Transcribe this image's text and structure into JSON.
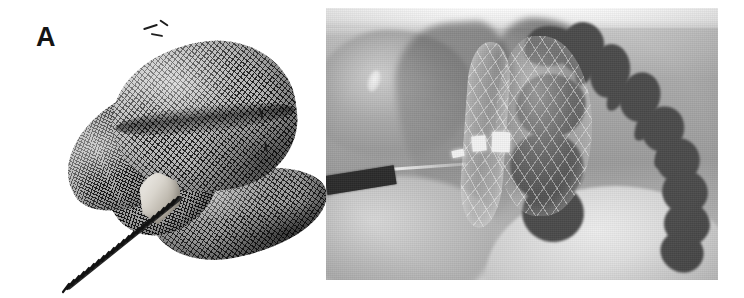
{
  "figure": {
    "panel_label": "A",
    "caption": "",
    "background_color": "#ffffff"
  },
  "device_panel": {
    "name": "braided-nitinol-occluder-photograph",
    "description": "Photograph of a self-expanding braided nitinol mesh occluder device with flared retention disc, conical hub and flexible delivery coil cable",
    "components": [
      {
        "id": "mesh-body",
        "label": "braided mesh cylindrical body"
      },
      {
        "id": "mesh-skirt",
        "label": "flared retention disc"
      },
      {
        "id": "mesh-rim",
        "label": "lower flange rim"
      },
      {
        "id": "mesh-flap",
        "label": "mesh flap"
      },
      {
        "id": "hub",
        "label": "conical screw hub"
      },
      {
        "id": "coil",
        "label": "flexible delivery coil cable"
      },
      {
        "id": "whiskers",
        "label": "protruding nitinol wire ends"
      }
    ],
    "colors": {
      "wire": "#1d1d1d",
      "mesh_midtone": "#b9b9b9",
      "hub_highlight": "#f2f0ec",
      "background": "#ffffff"
    }
  },
  "xray_panel": {
    "name": "fluoroscopic-radiograph",
    "description": "Lateral fluoroscopic radiograph showing the mesh device deployed in situ with delivery catheter entering from the lower left and the vertebral column visible at the right",
    "modality_look": "grayscale radiograph",
    "bounds": {
      "x": 326,
      "y": 8,
      "width": 392,
      "height": 272
    },
    "features": [
      {
        "id": "xray-topband",
        "label": "bright collimation band"
      },
      {
        "id": "tissue-shoulder",
        "label": "soft tissue shoulder shadow"
      },
      {
        "id": "shadow-left",
        "label": "mediastinal soft tissue shadow"
      },
      {
        "id": "xray-device",
        "label": "deployed mesh device"
      },
      {
        "id": "markers",
        "label": "radiopaque markers"
      },
      {
        "id": "catheter",
        "label": "delivery catheter"
      },
      {
        "id": "guidewire",
        "label": "guidewire"
      },
      {
        "id": "spine-group",
        "label": "vertebral column"
      },
      {
        "id": "diaphragm",
        "label": "diaphragmatic dome"
      }
    ],
    "colors": {
      "film_light": "#f4f4f4",
      "film_mid": "#9b9b9b",
      "bone_dark": "#4a4a4a",
      "catheter": "#2b2b2b",
      "marker": "#f2f2f2"
    }
  },
  "spine_segments": [
    {
      "x": 8,
      "y": 4,
      "w": 52,
      "h": 40,
      "r": "42% 58% 50% 50% / 60% 46% 54% 40%",
      "rot": -6
    },
    {
      "x": 44,
      "y": 0,
      "w": 44,
      "h": 52,
      "r": "50% 50% 46% 54% / 56% 44% 56% 44%",
      "rot": 4
    },
    {
      "x": 74,
      "y": 22,
      "w": 40,
      "h": 54,
      "r": "48% 52% 52% 48% / 50% 50% 50% 50%",
      "rot": 10
    },
    {
      "x": 104,
      "y": 50,
      "w": 40,
      "h": 50,
      "r": "50% 50% 48% 52% / 52% 48% 52% 48%",
      "rot": 14
    },
    {
      "x": 126,
      "y": 84,
      "w": 42,
      "h": 46,
      "r": "52% 48% 50% 50% / 50% 50% 50% 50%",
      "rot": 18
    },
    {
      "x": 140,
      "y": 116,
      "w": 44,
      "h": 44,
      "r": "50% 50% 52% 48% / 48% 52% 48% 52%",
      "rot": 20
    },
    {
      "x": 146,
      "y": 148,
      "w": 46,
      "h": 44,
      "r": "50% 50% 50% 50% / 50% 50% 50% 50%",
      "rot": 22
    },
    {
      "x": 148,
      "y": 180,
      "w": 46,
      "h": 44,
      "r": "48% 52% 50% 50% / 52% 48% 52% 48%",
      "rot": 24
    },
    {
      "x": 144,
      "y": 210,
      "w": 44,
      "h": 40,
      "r": "50% 50% 48% 52% / 50% 50% 50% 50%",
      "rot": 26
    },
    {
      "x": 0,
      "y": 52,
      "w": 70,
      "h": 64,
      "r": "46% 54% 52% 48% / 54% 46% 54% 46%",
      "rot": -2
    },
    {
      "x": -6,
      "y": 110,
      "w": 74,
      "h": 70,
      "r": "50% 50% 46% 54% / 48% 52% 48% 52%",
      "rot": 2
    },
    {
      "x": 6,
      "y": 162,
      "w": 62,
      "h": 58,
      "r": "52% 48% 50% 50% / 50% 50% 50% 50%",
      "rot": 6
    }
  ],
  "spine_spurs": [
    {
      "x": 60,
      "y": 30,
      "w": 18,
      "h": 34,
      "rot": 16
    },
    {
      "x": 92,
      "y": 56,
      "w": 17,
      "h": 34,
      "rot": 20
    },
    {
      "x": 120,
      "y": 88,
      "w": 17,
      "h": 32,
      "rot": 24
    },
    {
      "x": 140,
      "y": 118,
      "w": 18,
      "h": 30,
      "rot": 28
    },
    {
      "x": 156,
      "y": 146,
      "w": 18,
      "h": 30,
      "rot": 30
    },
    {
      "x": 164,
      "y": 176,
      "w": 18,
      "h": 28,
      "rot": 32
    },
    {
      "x": 160,
      "y": 206,
      "w": 18,
      "h": 26,
      "rot": 34
    }
  ],
  "device_markers": [
    {
      "x": 18,
      "y": 104,
      "w": 14,
      "h": 15,
      "rot": -6
    },
    {
      "x": 38,
      "y": 100,
      "w": 18,
      "h": 20,
      "rot": 2
    },
    {
      "x": -2,
      "y": 118,
      "w": 12,
      "h": 7,
      "rot": -12
    }
  ],
  "whiskers": [
    {
      "x": 88,
      "y": 6,
      "w": 15,
      "h": 2,
      "rot": -18
    },
    {
      "x": 96,
      "y": 14,
      "w": 12,
      "h": 2,
      "rot": 10
    },
    {
      "x": 104,
      "y": 2,
      "w": 10,
      "h": 2,
      "rot": 34
    },
    {
      "x": 200,
      "y": 92,
      "w": 12,
      "h": 2,
      "rot": 72
    },
    {
      "x": 206,
      "y": 126,
      "w": 10,
      "h": 2,
      "rot": 80
    }
  ]
}
